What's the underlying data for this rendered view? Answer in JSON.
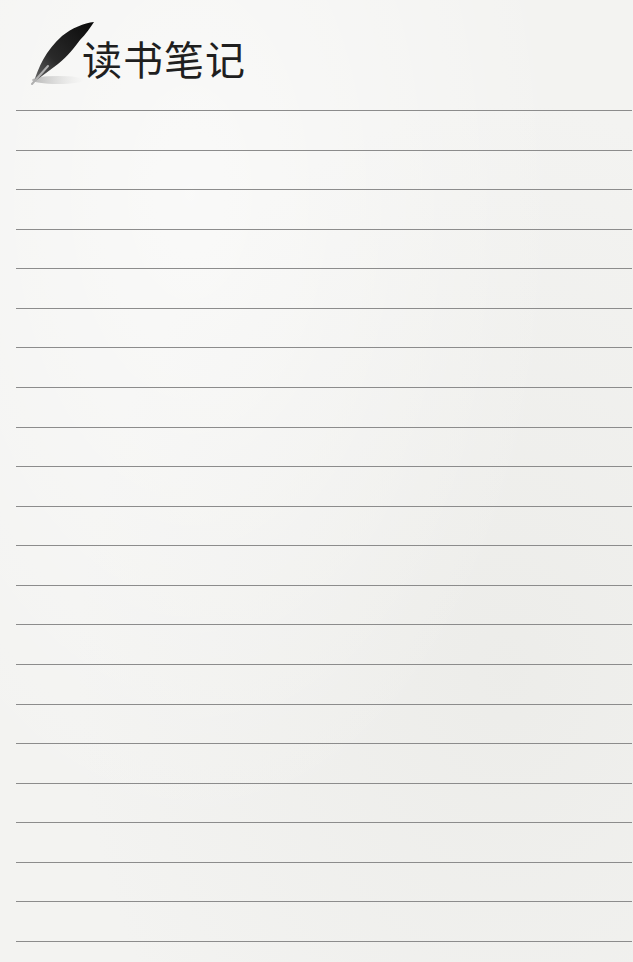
{
  "header": {
    "title": "读书笔记",
    "icon": "feather-quill-icon"
  },
  "notebook": {
    "line_count": 22,
    "first_line_y": 110,
    "line_spacing": 39.57,
    "line_color": "#8c8c8c",
    "background_color": "#f3f3f1",
    "lines": [
      "",
      "",
      "",
      "",
      "",
      "",
      "",
      "",
      "",
      "",
      "",
      "",
      "",
      "",
      "",
      "",
      "",
      "",
      "",
      "",
      "",
      ""
    ]
  }
}
